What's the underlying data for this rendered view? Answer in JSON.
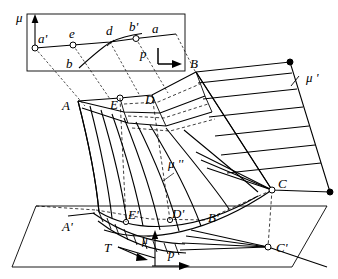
{
  "figure": {
    "background_color": "#ffffff",
    "line_color": "#000000",
    "width": 338,
    "height": 279
  },
  "inset": {
    "name": "upper-left detail box",
    "axis_label": "μ",
    "points": [
      {
        "id": "a-prime",
        "label": "a'",
        "x": 35,
        "y": 48,
        "marker": "open"
      },
      {
        "id": "e",
        "label": "e",
        "x": 73,
        "y": 45,
        "marker": "open"
      },
      {
        "id": "d",
        "label": "d",
        "x": 110,
        "y": 42,
        "marker": "tick"
      },
      {
        "id": "b-prime",
        "label": "b'",
        "x": 136,
        "y": 38,
        "marker": "open"
      },
      {
        "id": "a",
        "label": "a",
        "x": 152,
        "y": 35,
        "marker": "none"
      },
      {
        "id": "b",
        "label": "b",
        "x": 77,
        "y": 60,
        "marker": "none"
      },
      {
        "id": "p",
        "label": "p",
        "x": 143,
        "y": 56,
        "marker": "none"
      }
    ]
  },
  "labels": {
    "mu": "μ",
    "mu_prime": "μ '",
    "mu_double_prime": "μ ''",
    "mu_bar": "μ̄",
    "a_prime": "a'",
    "e": "e",
    "d": "d",
    "b_prime": "b'",
    "a": "a",
    "b": "b",
    "p_inset": "p",
    "A": "A",
    "B": "B",
    "C": "C",
    "D": "D",
    "E": "E",
    "A_prime": "A'",
    "B_prime": "B'",
    "C_prime": "C'",
    "D_prime": "D'",
    "E_prime": "E'",
    "T": "T",
    "p": "p"
  },
  "main": {
    "upper_points": [
      {
        "id": "A",
        "label": "A",
        "x": 72,
        "y": 101,
        "marker": "none"
      },
      {
        "id": "E",
        "label": "E",
        "x": 120,
        "y": 98,
        "marker": "open"
      },
      {
        "id": "D",
        "label": "D",
        "x": 152,
        "y": 95,
        "marker": "none"
      },
      {
        "id": "B",
        "label": "B",
        "x": 196,
        "y": 72,
        "marker": "none"
      },
      {
        "id": "C",
        "label": "C",
        "x": 272,
        "y": 190,
        "marker": "open"
      }
    ],
    "lower_points": [
      {
        "id": "A-prime",
        "label": "A'",
        "x": 75,
        "y": 228,
        "marker": "none"
      },
      {
        "id": "E-prime",
        "label": "E'",
        "x": 126,
        "y": 222,
        "marker": "open"
      },
      {
        "id": "D-prime",
        "label": "D'",
        "x": 170,
        "y": 220,
        "marker": "open"
      },
      {
        "id": "B-prime",
        "label": "B'",
        "x": 213,
        "y": 224,
        "marker": "none"
      },
      {
        "id": "C-prime",
        "label": "C'",
        "x": 268,
        "y": 247,
        "marker": "open"
      }
    ],
    "ruled_surface_right": {
      "name": "mu-prime ruled surface",
      "rule_count": 7,
      "label": "μ '"
    },
    "curved_surface_center": {
      "name": "mu-double-prime curved ruled surface",
      "generator_count": 9,
      "label": "μ ''"
    },
    "base_plane": {
      "name": "horizontal base plane parallelogram"
    },
    "tangent_vector": {
      "label": "T"
    },
    "direction_vector": {
      "label": "p"
    }
  }
}
